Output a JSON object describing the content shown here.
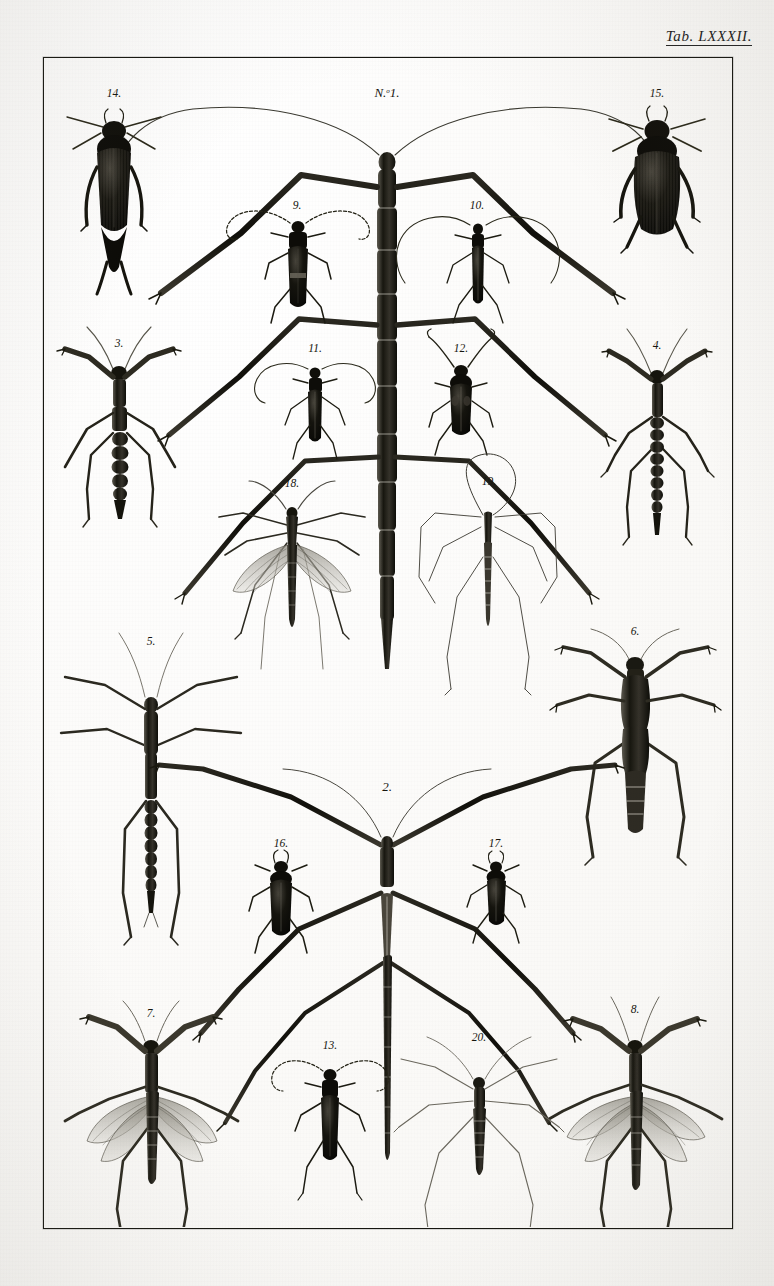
{
  "plate": {
    "tab_prefix": "Tab.",
    "tab_number": "LXXXII.",
    "background_color": "#fbfaf8",
    "ink_color": "#15150f",
    "frame_color": "#15150f"
  },
  "figures": [
    {
      "id": "n1",
      "label": "N.º 1.",
      "name": "giant-stick-insect",
      "kind": "stick-insect",
      "row": 1,
      "position": "center-top"
    },
    {
      "id": "f14",
      "label": "14.",
      "name": "dark-beetle-forked-cerci",
      "kind": "beetle",
      "row": 1,
      "position": "top-left"
    },
    {
      "id": "f15",
      "label": "15.",
      "name": "broad-dark-beetle",
      "kind": "beetle",
      "row": 1,
      "position": "top-right"
    },
    {
      "id": "f9",
      "label": "9.",
      "name": "longhorn-beetle-dark",
      "kind": "longhorn",
      "row": 2,
      "position": "inner-left"
    },
    {
      "id": "f10",
      "label": "10.",
      "name": "longhorn-beetle-slender",
      "kind": "longhorn",
      "row": 2,
      "position": "inner-right"
    },
    {
      "id": "f3",
      "label": "3.",
      "name": "mantis-nymph-left",
      "kind": "mantis",
      "row": 3,
      "position": "left"
    },
    {
      "id": "f4",
      "label": "4.",
      "name": "mantis-nymph-right",
      "kind": "mantis",
      "row": 3,
      "position": "right"
    },
    {
      "id": "f11",
      "label": "11.",
      "name": "longhorn-beetle-banded",
      "kind": "longhorn",
      "row": 3,
      "position": "inner-left"
    },
    {
      "id": "f12",
      "label": "12.",
      "name": "weevil-beetle",
      "kind": "beetle",
      "row": 3,
      "position": "inner-right"
    },
    {
      "id": "f18",
      "label": "18.",
      "name": "crane-fly-winged",
      "kind": "crane-fly",
      "row": 4,
      "position": "inner-left"
    },
    {
      "id": "f19",
      "label": "19.",
      "name": "crane-fly-outline",
      "kind": "crane-fly",
      "row": 4,
      "position": "inner-right"
    },
    {
      "id": "f5",
      "label": "5.",
      "name": "walking-stick-left",
      "kind": "stick-insect",
      "row": 5,
      "position": "left"
    },
    {
      "id": "f6",
      "label": "6.",
      "name": "broad-thorax-insect",
      "kind": "orthopteran",
      "row": 5,
      "position": "right"
    },
    {
      "id": "f2",
      "label": "2.",
      "name": "stick-insect-lower",
      "kind": "stick-insect",
      "row": 6,
      "position": "center-bottom"
    },
    {
      "id": "f16",
      "label": "16.",
      "name": "oval-beetle-left",
      "kind": "beetle",
      "row": 6,
      "position": "inner-left"
    },
    {
      "id": "f17",
      "label": "17.",
      "name": "oval-beetle-right",
      "kind": "beetle",
      "row": 6,
      "position": "inner-right"
    },
    {
      "id": "f7",
      "label": "7.",
      "name": "winged-mantis-left",
      "kind": "mantis",
      "row": 7,
      "position": "bottom-left"
    },
    {
      "id": "f8",
      "label": "8.",
      "name": "winged-mantis-right",
      "kind": "mantis",
      "row": 7,
      "position": "bottom-right"
    },
    {
      "id": "f13",
      "label": "13.",
      "name": "longhorn-beetle-bottom",
      "kind": "longhorn",
      "row": 7,
      "position": "inner-left"
    },
    {
      "id": "f20",
      "label": "20.",
      "name": "long-legged-bug",
      "kind": "true-bug",
      "row": 7,
      "position": "inner-right"
    }
  ]
}
